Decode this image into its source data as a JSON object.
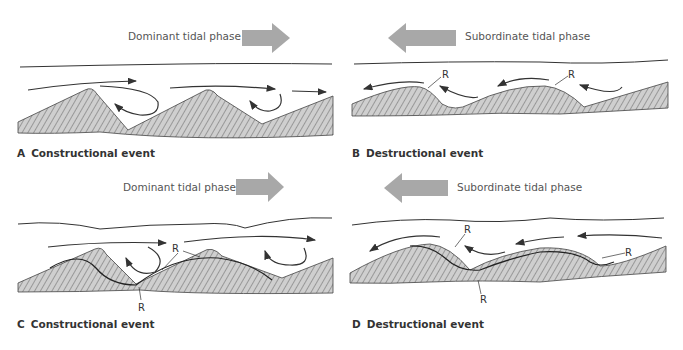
{
  "panels": [
    {
      "letter": "A",
      "caption": "Constructional event",
      "phase": "Dominant tidal phase",
      "direction": "right"
    },
    {
      "letter": "B",
      "caption": "Destructional event",
      "phase": "Subordinate tidal phase",
      "direction": "left"
    },
    {
      "letter": "C",
      "caption": "Constructional event",
      "phase": "Dominant tidal phase",
      "direction": "right"
    },
    {
      "letter": "D",
      "caption": "Destructional event",
      "phase": "Subordinate tidal phase",
      "direction": "left"
    }
  ],
  "reactivation_label": "R",
  "colors": {
    "arrow": "#a8a8a8",
    "sediment": "#c8c8c8",
    "line": "#333333"
  }
}
